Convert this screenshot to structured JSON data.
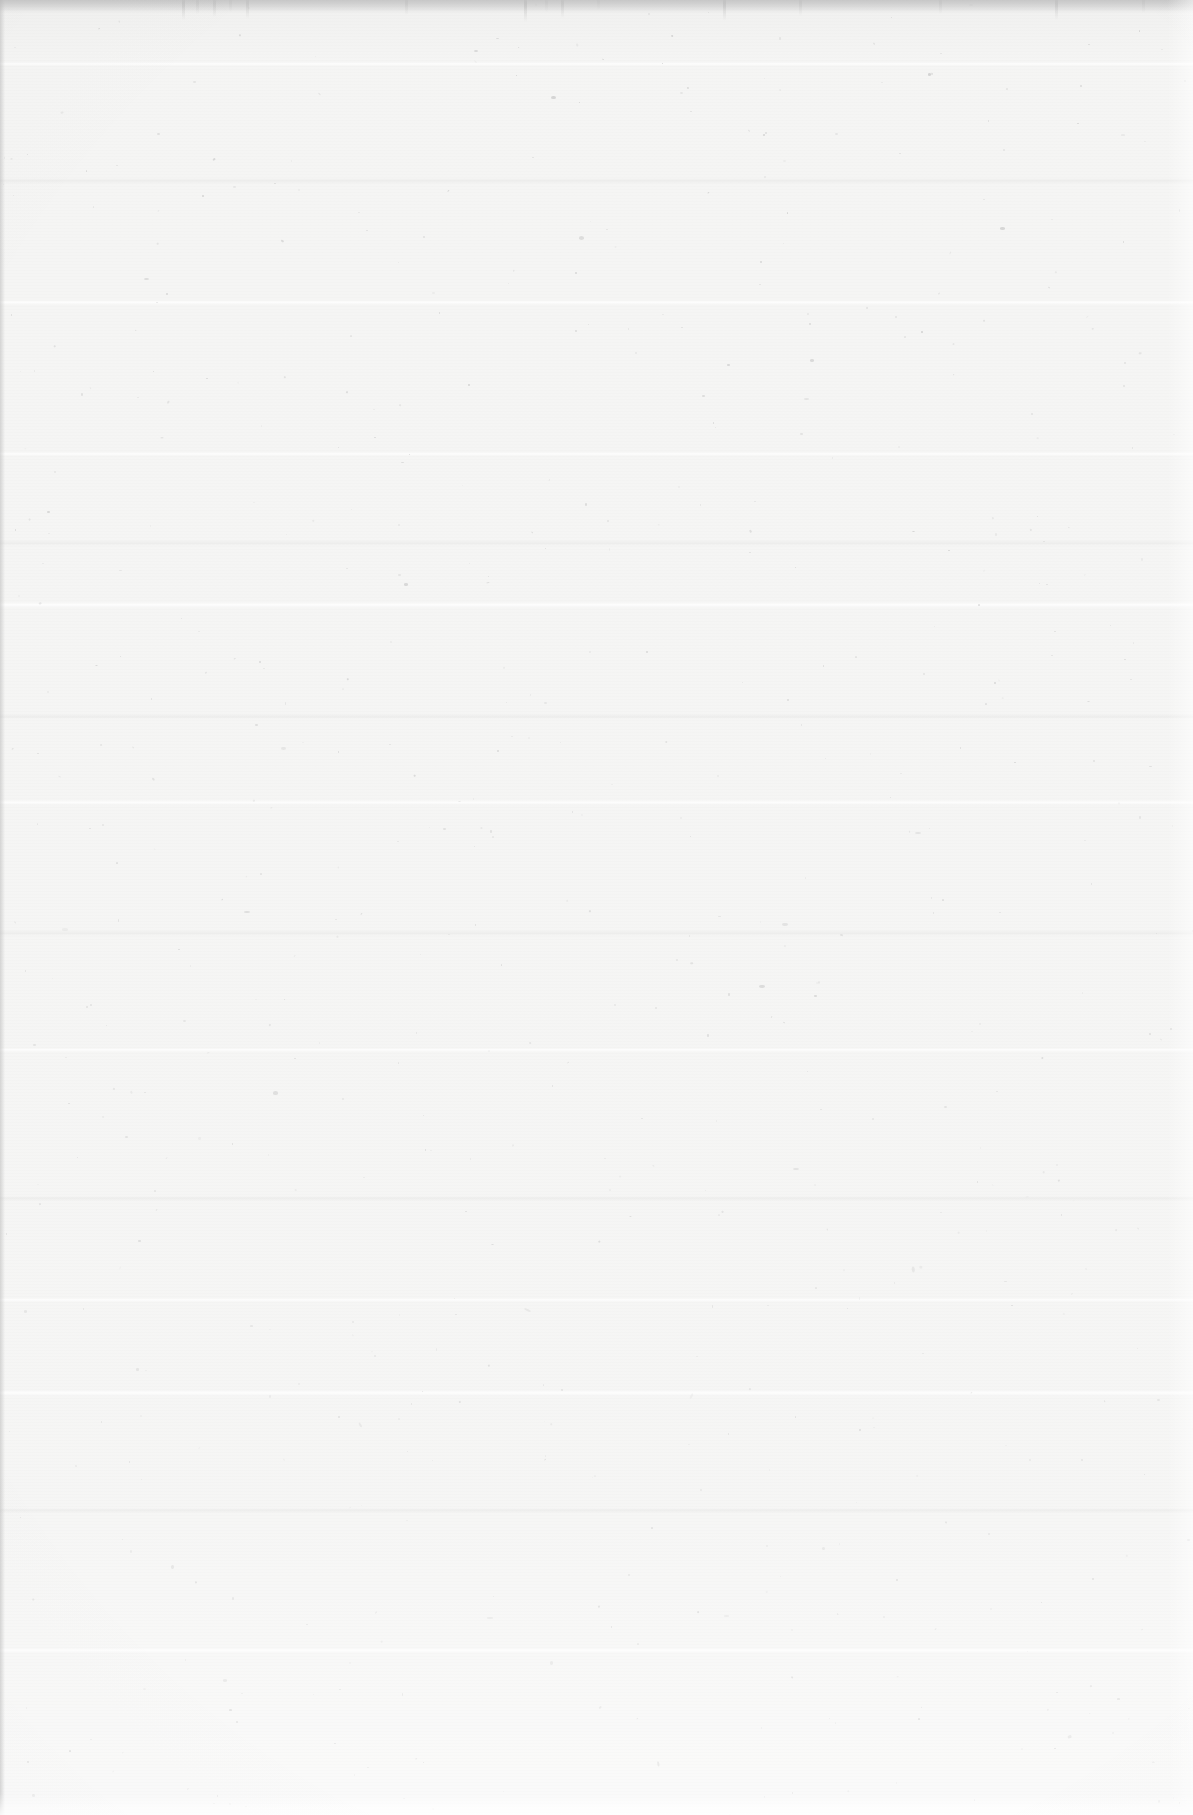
{
  "page": {
    "kind": "scanned-blank-page",
    "width": 1193,
    "height": 1815,
    "visible_text": "",
    "paper_color": "#f5f4f3",
    "speckle_color": "#b9b9b9",
    "top_edge_color": "#c4c4c4",
    "bottom_edge_color": "#ffffff"
  },
  "artifacts": {
    "scan_seams": [
      {
        "y": 62,
        "height": 4,
        "type": "bright"
      },
      {
        "y": 178,
        "height": 6,
        "type": "dim"
      },
      {
        "y": 300,
        "height": 5,
        "type": "bright"
      },
      {
        "y": 452,
        "height": 4,
        "type": "bright"
      },
      {
        "y": 540,
        "height": 6,
        "type": "dim"
      },
      {
        "y": 602,
        "height": 6,
        "type": "bright"
      },
      {
        "y": 714,
        "height": 5,
        "type": "dim"
      },
      {
        "y": 800,
        "height": 5,
        "type": "bright"
      },
      {
        "y": 930,
        "height": 6,
        "type": "dim"
      },
      {
        "y": 1048,
        "height": 4,
        "type": "bright"
      },
      {
        "y": 1196,
        "height": 5,
        "type": "dim"
      },
      {
        "y": 1298,
        "height": 4,
        "type": "bright"
      },
      {
        "y": 1390,
        "height": 6,
        "type": "bright"
      },
      {
        "y": 1508,
        "height": 5,
        "type": "dim"
      },
      {
        "y": 1648,
        "height": 5,
        "type": "bright"
      }
    ],
    "top_streaks": [
      {
        "x": 182,
        "height": 20,
        "opacity": 0.55
      },
      {
        "x": 196,
        "height": 14,
        "opacity": 0.4
      },
      {
        "x": 213,
        "height": 17,
        "opacity": 0.5
      },
      {
        "x": 229,
        "height": 12,
        "opacity": 0.35
      },
      {
        "x": 246,
        "height": 19,
        "opacity": 0.48
      },
      {
        "x": 405,
        "height": 15,
        "opacity": 0.45
      },
      {
        "x": 524,
        "height": 22,
        "opacity": 0.6
      },
      {
        "x": 545,
        "height": 12,
        "opacity": 0.32
      },
      {
        "x": 561,
        "height": 18,
        "opacity": 0.5
      },
      {
        "x": 597,
        "height": 10,
        "opacity": 0.3
      },
      {
        "x": 723,
        "height": 21,
        "opacity": 0.55
      },
      {
        "x": 799,
        "height": 16,
        "opacity": 0.42
      },
      {
        "x": 939,
        "height": 14,
        "opacity": 0.38
      },
      {
        "x": 1055,
        "height": 20,
        "opacity": 0.52
      },
      {
        "x": 1142,
        "height": 13,
        "opacity": 0.36
      }
    ],
    "speckle_count": 620,
    "speckle_seed": 20240611
  }
}
